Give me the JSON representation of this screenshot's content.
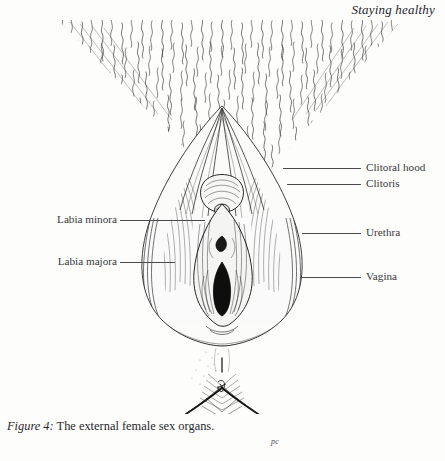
{
  "page": {
    "running_head": "Staying healthy",
    "background_color": "#fdfdfc",
    "ink_color": "#2e2e2e"
  },
  "figure": {
    "caption_lead": "Figure 4:",
    "caption_text": " The external female sex organs.",
    "artist_signature": "pc",
    "illustration_name": "external-female-sex-organs-pen-and-ink-drawing",
    "labels": {
      "right": [
        {
          "name": "clitoral-hood",
          "text": "Clitoral hood",
          "y": 162,
          "leader_x": 283,
          "leader_w": 78,
          "text_x": 366
        },
        {
          "name": "clitoris",
          "text": "Clitoris",
          "y": 178,
          "leader_x": 287,
          "leader_w": 74,
          "text_x": 366
        },
        {
          "name": "urethra",
          "text": "Urethra",
          "y": 227,
          "leader_x": 302,
          "leader_w": 59,
          "text_x": 366
        },
        {
          "name": "vagina",
          "text": "Vagina",
          "y": 271,
          "leader_x": 300,
          "leader_w": 61,
          "text_x": 366
        }
      ],
      "left": [
        {
          "name": "labia-minora",
          "text": "Labia minora",
          "y": 214,
          "leader_x": 120,
          "leader_w": 85,
          "text_right_x": 328
        },
        {
          "name": "labia-majora",
          "text": "Labia majora",
          "y": 256,
          "leader_x": 120,
          "leader_w": 55,
          "text_right_x": 328
        }
      ]
    }
  }
}
